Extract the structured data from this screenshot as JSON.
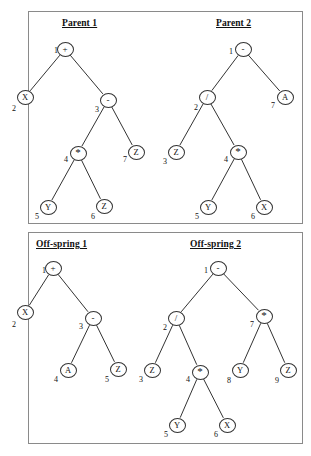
{
  "figure": {
    "panels": [
      {
        "id": "parents",
        "titles": [
          "Parent 1",
          "Parent 2"
        ]
      },
      {
        "id": "offspring",
        "titles": [
          "Off-spring 1",
          "Off-spring 2"
        ]
      }
    ]
  },
  "trees": {
    "parent1": {
      "title": "Parent 1",
      "nodes": [
        {
          "index": "1",
          "label": "+",
          "kind": "operator",
          "x": 65,
          "y": 49,
          "ix": 54,
          "iy": 46
        },
        {
          "index": "2",
          "label": "X",
          "kind": "terminal",
          "x": 25,
          "y": 97,
          "ix": 12,
          "iy": 104
        },
        {
          "index": "3",
          "label": "-",
          "kind": "operator",
          "x": 108,
          "y": 100,
          "ix": 95,
          "iy": 105
        },
        {
          "index": "4",
          "label": "*",
          "kind": "operator",
          "x": 78,
          "y": 153,
          "ix": 64,
          "iy": 155
        },
        {
          "index": "7",
          "label": "Z",
          "kind": "terminal",
          "x": 136,
          "y": 152,
          "ix": 123,
          "iy": 155
        },
        {
          "index": "5",
          "label": "Y",
          "kind": "terminal",
          "x": 48,
          "y": 207,
          "ix": 35,
          "iy": 212
        },
        {
          "index": "6",
          "label": "Z",
          "kind": "terminal",
          "x": 104,
          "y": 206,
          "ix": 91,
          "iy": 212
        }
      ],
      "edges": [
        {
          "from": "1",
          "to": "2"
        },
        {
          "from": "1",
          "to": "3"
        },
        {
          "from": "3",
          "to": "4"
        },
        {
          "from": "3",
          "to": "7"
        },
        {
          "from": "4",
          "to": "5"
        },
        {
          "from": "4",
          "to": "6"
        }
      ],
      "expression": "X + (Y * Z - Z)"
    },
    "parent2": {
      "title": "Parent 2",
      "nodes": [
        {
          "index": "1",
          "label": "-",
          "kind": "operator",
          "x": 243,
          "y": 49,
          "ix": 229,
          "iy": 47
        },
        {
          "index": "2",
          "label": "/",
          "kind": "operator",
          "x": 207,
          "y": 97,
          "ix": 194,
          "iy": 103
        },
        {
          "index": "7",
          "label": "A",
          "kind": "terminal",
          "x": 285,
          "y": 97,
          "ix": 271,
          "iy": 101
        },
        {
          "index": "3",
          "label": "Z",
          "kind": "terminal",
          "x": 176,
          "y": 152,
          "ix": 163,
          "iy": 157
        },
        {
          "index": "4",
          "label": "*",
          "kind": "operator",
          "x": 238,
          "y": 152,
          "ix": 224,
          "iy": 155
        },
        {
          "index": "5",
          "label": "Y",
          "kind": "terminal",
          "x": 208,
          "y": 207,
          "ix": 195,
          "iy": 212
        },
        {
          "index": "6",
          "label": "X",
          "kind": "terminal",
          "x": 264,
          "y": 207,
          "ix": 251,
          "iy": 212
        }
      ],
      "edges": [
        {
          "from": "1",
          "to": "2"
        },
        {
          "from": "1",
          "to": "7"
        },
        {
          "from": "2",
          "to": "3"
        },
        {
          "from": "2",
          "to": "4"
        },
        {
          "from": "4",
          "to": "5"
        },
        {
          "from": "4",
          "to": "6"
        }
      ],
      "expression": "(Z / (Y * X)) - A"
    },
    "offspring1": {
      "title": "Off-spring 1",
      "nodes": [
        {
          "index": "1",
          "label": "+",
          "kind": "operator",
          "x": 53,
          "y": 268,
          "ix": 42,
          "iy": 266
        },
        {
          "index": "2",
          "label": "X",
          "kind": "terminal",
          "x": 25,
          "y": 312,
          "ix": 12,
          "iy": 320
        },
        {
          "index": "3",
          "label": "-",
          "kind": "operator",
          "x": 93,
          "y": 318,
          "ix": 79,
          "iy": 322
        },
        {
          "index": "4",
          "label": "A",
          "kind": "terminal",
          "x": 68,
          "y": 370,
          "ix": 54,
          "iy": 375
        },
        {
          "index": "5",
          "label": "Z",
          "kind": "terminal",
          "x": 118,
          "y": 369,
          "ix": 105,
          "iy": 375
        }
      ],
      "edges": [
        {
          "from": "1",
          "to": "2"
        },
        {
          "from": "1",
          "to": "3"
        },
        {
          "from": "3",
          "to": "4"
        },
        {
          "from": "3",
          "to": "5"
        }
      ],
      "expression": "X + (A - Z)"
    },
    "offspring2": {
      "title": "Off-spring 2",
      "nodes": [
        {
          "index": "1",
          "label": "-",
          "kind": "operator",
          "x": 218,
          "y": 268,
          "ix": 204,
          "iy": 266
        },
        {
          "index": "2",
          "label": "/",
          "kind": "operator",
          "x": 176,
          "y": 318,
          "ix": 163,
          "iy": 323
        },
        {
          "index": "7",
          "label": "*",
          "kind": "operator",
          "x": 264,
          "y": 316,
          "ix": 250,
          "iy": 320
        },
        {
          "index": "3",
          "label": "Z",
          "kind": "terminal",
          "x": 152,
          "y": 370,
          "ix": 139,
          "iy": 375
        },
        {
          "index": "4",
          "label": "*",
          "kind": "operator",
          "x": 200,
          "y": 372,
          "ix": 186,
          "iy": 375
        },
        {
          "index": "8",
          "label": "Y",
          "kind": "terminal",
          "x": 240,
          "y": 370,
          "ix": 227,
          "iy": 376
        },
        {
          "index": "9",
          "label": "Z",
          "kind": "terminal",
          "x": 288,
          "y": 370,
          "ix": 275,
          "iy": 376
        },
        {
          "index": "5",
          "label": "Y",
          "kind": "terminal",
          "x": 177,
          "y": 425,
          "ix": 164,
          "iy": 430
        },
        {
          "index": "6",
          "label": "X",
          "kind": "terminal",
          "x": 227,
          "y": 425,
          "ix": 214,
          "iy": 430
        }
      ],
      "edges": [
        {
          "from": "1",
          "to": "2"
        },
        {
          "from": "1",
          "to": "7"
        },
        {
          "from": "2",
          "to": "3"
        },
        {
          "from": "2",
          "to": "4"
        },
        {
          "from": "7",
          "to": "8"
        },
        {
          "from": "7",
          "to": "9"
        },
        {
          "from": "4",
          "to": "5"
        },
        {
          "from": "4",
          "to": "6"
        }
      ],
      "expression": "(Z / (Y * X)) - (Y * Z)"
    }
  },
  "colors": {
    "line": "#333333",
    "border": "#8a8a8a",
    "text": "#111111",
    "background": "#ffffff"
  }
}
